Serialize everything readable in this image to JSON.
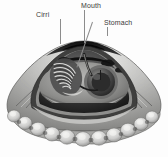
{
  "figure": {
    "background_color": "#fdfdfd",
    "style": "grayscale halftone illustration",
    "width": 168,
    "height": 157
  },
  "labels": {
    "cirri": "Cirri",
    "mouth": "Mouth",
    "stomach": "Stomach"
  },
  "leaders": {
    "cirri_color": "#8c8c8c",
    "mouth_color": "#8c8c8c",
    "stomach_color": "#8c8c8c",
    "stomach_inner_color": "#1b1b1b"
  },
  "palette": {
    "shell_light": "#e8e8e6",
    "shell_mid": "#b6b6b4",
    "shell_dark": "#6d6d6c",
    "interior_dark": "#2a2a2a",
    "interior_black": "#121212",
    "mantle_gray": "#9a9a98",
    "organ_gray": "#787878",
    "highlight": "#f4f4f2"
  },
  "structures": {
    "cirri": "spiral tentacle coil, left interior",
    "mouth": "apex hinge opening, top center",
    "stomach": "dark round organ, right of center",
    "mantle_edge": "scalloped lobed margin along bottom",
    "shell_ribs": "radiating ribs fanning from apex"
  }
}
